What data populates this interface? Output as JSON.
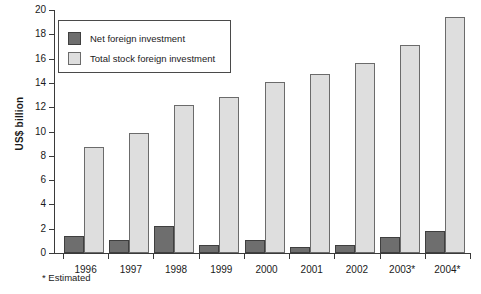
{
  "chart_data": {
    "type": "bar",
    "title": "",
    "xlabel": "",
    "ylabel": "US$ billion",
    "ylim": [
      0,
      20
    ],
    "ytick_step": 2,
    "yticks": [
      "0",
      "2",
      "4",
      "6",
      "8",
      "10",
      "12",
      "14",
      "16",
      "18",
      "20"
    ],
    "grid": false,
    "legend_position": "top-left",
    "categories": [
      "1996",
      "1997",
      "1998",
      "1999",
      "2000",
      "2001",
      "2002",
      "2003*",
      "2004*"
    ],
    "series": [
      {
        "name": "Net foreign investment",
        "color": "#6e6e6e",
        "values": [
          1.4,
          1.1,
          2.2,
          0.7,
          1.1,
          0.5,
          0.7,
          1.35,
          1.8
        ]
      },
      {
        "name": "Total stock foreign investment",
        "color": "#dedede",
        "values": [
          8.7,
          9.9,
          12.2,
          12.8,
          14.1,
          14.7,
          15.6,
          17.1,
          19.4
        ]
      }
    ],
    "annotations": [
      "* Estimated"
    ]
  },
  "legend": {
    "items": [
      {
        "label": "Net foreign investment",
        "swatch": "net"
      },
      {
        "label": "Total stock foreign investment",
        "swatch": "total"
      }
    ]
  },
  "footnote": {
    "text": "* Estimated"
  }
}
